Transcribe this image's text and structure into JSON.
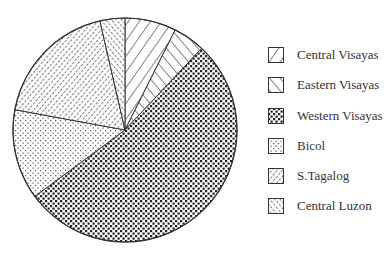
{
  "chart_data": {
    "type": "pie",
    "title": "",
    "start_angle_deg": 0,
    "direction": "clockwise",
    "slices": [
      {
        "label": "Central Visayas",
        "value": 7.4,
        "pattern": "diag-wide-up"
      },
      {
        "label": "Eastern Visayas",
        "value": 4.6,
        "pattern": "diag-wide-down"
      },
      {
        "label": "Western Visayas",
        "value": 52.9,
        "pattern": "dense-dots"
      },
      {
        "label": "Bicol",
        "value": 13.0,
        "pattern": "light-dots"
      },
      {
        "label": "S.Tagalog",
        "value": 18.5,
        "pattern": "diag-fine-up"
      },
      {
        "label": "Central Luzon",
        "value": 3.6,
        "pattern": "diag-fine-down"
      }
    ],
    "legend_position": "right"
  },
  "legend": {
    "items": [
      {
        "label": "Central Visayas"
      },
      {
        "label": "Eastern Visayas"
      },
      {
        "label": "Western Visayas"
      },
      {
        "label": "Bicol"
      },
      {
        "label": "S.Tagalog"
      },
      {
        "label": "Central Luzon"
      }
    ]
  },
  "colors": {
    "stroke": "#333333",
    "fill": "#222222",
    "background": "#ffffff"
  }
}
